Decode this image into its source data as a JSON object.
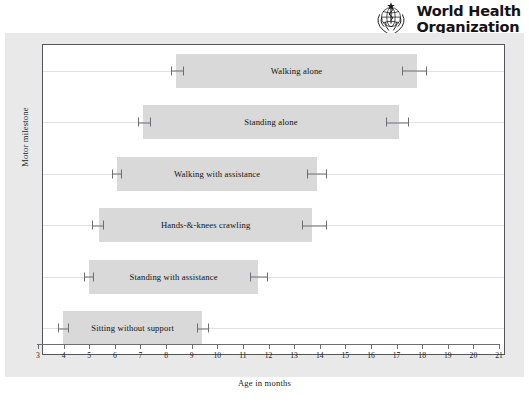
{
  "branding": {
    "emblem_icon": "who-emblem-icon",
    "line1": "World Health",
    "line2": "Organization"
  },
  "chart_data": {
    "type": "bar",
    "orientation": "horizontal",
    "title": "",
    "xlabel": "Age in months",
    "ylabel": "Motor milestone",
    "xlim": [
      3,
      21
    ],
    "xticks": [
      3,
      4,
      5,
      6,
      7,
      8,
      9,
      10,
      11,
      12,
      13,
      14,
      15,
      16,
      17,
      18,
      19,
      20,
      21
    ],
    "xtick_labels": [
      "3",
      "4",
      "5",
      "6",
      "7",
      "8",
      "9",
      "10",
      "11",
      "12",
      "13",
      "14",
      "15",
      "16",
      "17",
      "18",
      "19",
      "20",
      "21"
    ],
    "grid": "horizontal",
    "legend": "none",
    "bar_color": "#d9d9d9",
    "whisker_color": "#6d6e71",
    "plot_background": "#ffffff",
    "panel_background": "#e9e9e9",
    "categories": [
      "Walking alone",
      "Standing alone",
      "Walking with assistance",
      "Hands-&-knees crawling",
      "Standing with assistance",
      "Sitting without support"
    ],
    "bars": [
      {
        "label": "Walking alone",
        "start": 8.2,
        "end": 17.6,
        "start_ci": [
          8.0,
          8.5
        ],
        "end_ci": [
          17.0,
          18.0
        ]
      },
      {
        "label": "Standing alone",
        "start": 6.9,
        "end": 16.9,
        "start_ci": [
          6.7,
          7.2
        ],
        "end_ci": [
          16.4,
          17.3
        ]
      },
      {
        "label": "Walking with assistance",
        "start": 5.9,
        "end": 13.7,
        "start_ci": [
          5.7,
          6.1
        ],
        "end_ci": [
          13.3,
          14.1
        ]
      },
      {
        "label": "Hands-&-knees crawling",
        "start": 5.2,
        "end": 13.5,
        "start_ci": [
          4.9,
          5.4
        ],
        "end_ci": [
          13.1,
          14.1
        ]
      },
      {
        "label": "Standing with assistance",
        "start": 4.8,
        "end": 11.4,
        "start_ci": [
          4.6,
          5.0
        ],
        "end_ci": [
          11.1,
          11.8
        ]
      },
      {
        "label": "Sitting without support",
        "start": 3.8,
        "end": 9.2,
        "start_ci": [
          3.6,
          4.0
        ],
        "end_ci": [
          9.0,
          9.5
        ]
      }
    ]
  }
}
